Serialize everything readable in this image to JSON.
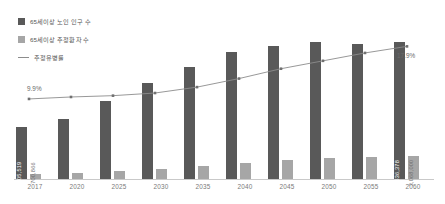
{
  "chart_data": {
    "type": "bar",
    "title": "",
    "xlabel": "",
    "ylabel": "",
    "grid": false,
    "legend_position": "top-left",
    "categories": [
      "2017",
      "2020",
      "2025",
      "2030",
      "2035",
      "2040",
      "2045",
      "2050",
      "2055",
      "2060"
    ],
    "series": [
      {
        "name": "65세이상 노인 인구 수",
        "type": "bar",
        "color": "#595959",
        "values": [
          7005519,
          8125000,
          10510000,
          12950000,
          15170000,
          17120000,
          17950000,
          18450000,
          18300000,
          18536378
        ],
        "point_labels": [
          "7,005,519",
          "",
          "",
          "",
          "",
          "",
          "",
          "",
          "",
          "18,536,378"
        ]
      },
      {
        "name": "65세이상 추정환자 수",
        "type": "bar",
        "color": "#a6a6a6",
        "values": [
          700866,
          830000,
          1090000,
          1400000,
          1780000,
          2220000,
          2600000,
          2900000,
          3010000,
          3068000
        ],
        "point_labels": [
          "700,866",
          "",
          "",
          "",
          "",
          "",
          "",
          "",
          "",
          "3,068,000"
        ]
      },
      {
        "name": "추정유병률",
        "type": "line",
        "color": "#8c8c8c",
        "unit": "%",
        "values": [
          9.9,
          10.2,
          10.4,
          10.8,
          11.7,
          13.0,
          14.5,
          15.7,
          16.9,
          17.9
        ],
        "point_labels": [
          "9.9%",
          "",
          "",
          "",
          "",
          "",
          "",
          "",
          "",
          "17.9%"
        ]
      }
    ],
    "annotations": [
      {
        "text": "9.9%",
        "category": "2017"
      },
      {
        "text": "17.9%",
        "category": "2060"
      }
    ]
  },
  "legend": {
    "items": [
      {
        "label": "65세이상 노인 인구 수",
        "marker": "square-dark"
      },
      {
        "label": "65세이상 추정환자 수",
        "marker": "square-light"
      },
      {
        "label": "추정유병률",
        "marker": "line"
      }
    ]
  }
}
